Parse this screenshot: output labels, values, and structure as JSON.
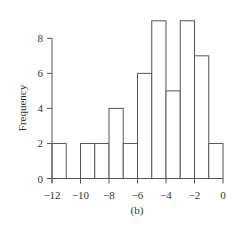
{
  "chart_data": {
    "type": "bar",
    "subtype": "histogram",
    "title": "",
    "caption": "(b)",
    "xlabel": "",
    "ylabel": "Frequency",
    "bins": [
      {
        "start": -12,
        "end": -11,
        "count": 2
      },
      {
        "start": -11,
        "end": -10,
        "count": 0
      },
      {
        "start": -10,
        "end": -9,
        "count": 2
      },
      {
        "start": -9,
        "end": -8,
        "count": 2
      },
      {
        "start": -8,
        "end": -7,
        "count": 4
      },
      {
        "start": -7,
        "end": -6,
        "count": 2
      },
      {
        "start": -6,
        "end": -5,
        "count": 6
      },
      {
        "start": -5,
        "end": -4,
        "count": 9
      },
      {
        "start": -4,
        "end": -3,
        "count": 5
      },
      {
        "start": -3,
        "end": -2,
        "count": 9
      },
      {
        "start": -2,
        "end": -1,
        "count": 7
      },
      {
        "start": -1,
        "end": 0,
        "count": 2
      }
    ],
    "xlim": [
      -12,
      0
    ],
    "ylim": [
      0,
      8
    ],
    "xticks": [
      -12,
      -10,
      -8,
      -6,
      -4,
      -2,
      0
    ],
    "xtick_labels": [
      "−12",
      "−10",
      "−8",
      "−6",
      "−4",
      "−2",
      "0"
    ],
    "yticks": [
      0,
      2,
      4,
      6,
      8
    ],
    "ytick_labels": [
      "0",
      "2",
      "4",
      "6",
      "8"
    ],
    "grid": false,
    "legend": null,
    "colors": {
      "bar_fill": "#ffffff",
      "bar_stroke": "#555555",
      "text": "#333333"
    }
  }
}
